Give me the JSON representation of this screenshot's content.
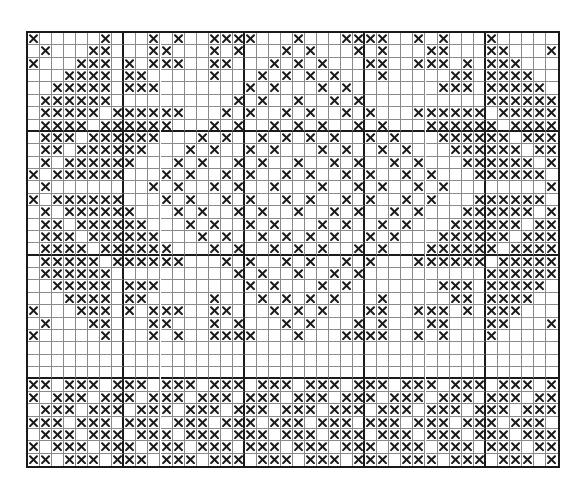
{
  "title": "Cross-stitch pattern chart",
  "grid": {
    "cols": 44,
    "rows": 35,
    "cell_w": 12.14,
    "cell_h": 12.49,
    "thick_col_lines": [
      8,
      18,
      28,
      38
    ],
    "thick_row_lines": [
      8,
      18,
      28
    ],
    "stitch_color": "#1a1a1a",
    "line_color": "#8a8a8a",
    "background": "#ffffff"
  },
  "motif": {
    "description": "Upper-left quadrant stitches (rows 0-12, cols 0-22); mirrored horizontally about col 22 and vertically about row 12",
    "mirror_col": 22,
    "mirror_row": 12,
    "rows": [
      [
        0,
        6,
        10,
        12,
        15,
        16,
        17,
        18,
        22
      ],
      [
        1,
        5,
        6,
        10,
        11,
        15,
        17,
        21
      ],
      [
        0,
        4,
        5,
        6,
        8,
        10,
        11,
        12,
        15,
        16,
        20,
        22
      ],
      [
        3,
        4,
        5,
        6,
        8,
        9,
        15,
        19,
        21
      ],
      [
        2,
        3,
        4,
        5,
        6,
        8,
        9,
        10,
        18,
        20
      ],
      [
        1,
        2,
        3,
        4,
        5,
        6,
        17,
        19,
        22
      ],
      [
        1,
        2,
        3,
        4,
        5,
        7,
        8,
        9,
        10,
        11,
        12,
        16,
        18,
        21
      ],
      [
        1,
        2,
        3,
        4,
        6,
        7,
        8,
        9,
        10,
        11,
        15,
        17,
        20,
        22
      ],
      [
        1,
        2,
        3,
        5,
        6,
        7,
        8,
        9,
        10,
        14,
        16,
        19,
        21
      ],
      [
        1,
        2,
        4,
        5,
        6,
        7,
        8,
        9,
        13,
        15,
        18,
        20
      ],
      [
        1,
        3,
        4,
        5,
        6,
        7,
        8,
        12,
        14,
        17,
        19,
        22
      ],
      [
        0,
        2,
        3,
        4,
        5,
        6,
        7,
        11,
        13,
        16,
        18,
        21
      ],
      [
        1,
        10,
        12,
        15,
        17,
        20
      ]
    ]
  },
  "empty_rows": [
    25,
    26,
    27
  ],
  "border": {
    "description": "Bottom border band rows 28-34; every cell stitched except where col mod 4 equals blank_mod",
    "start_row": 28,
    "rows_blank_mod": [
      2,
      1,
      0,
      3,
      0,
      1,
      2
    ]
  }
}
